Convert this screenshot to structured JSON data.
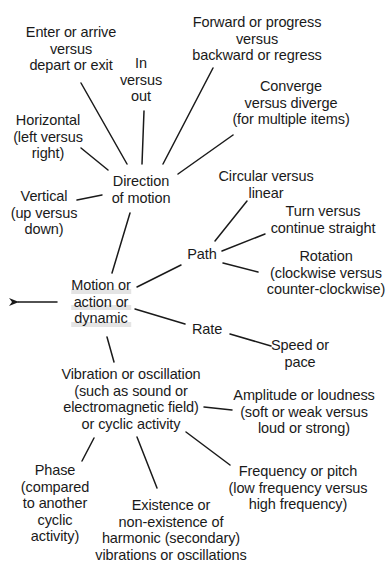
{
  "diagram": {
    "type": "concept-map",
    "colors": {
      "line": "#1a1a1a",
      "text": "#1a1a1a",
      "background": "#ffffff",
      "root_highlight": "#e4e4e4"
    },
    "root": {
      "id": "motion",
      "lines": [
        "Motion or",
        "action or",
        "dynamic"
      ],
      "arrow": "left-arrow"
    },
    "nodes": {
      "direction": {
        "lines": [
          "Direction",
          "of motion"
        ]
      },
      "enter": {
        "lines": [
          "Enter or arrive",
          "versus",
          "depart or exit"
        ]
      },
      "inout": {
        "lines": [
          "In",
          "versus",
          "out"
        ]
      },
      "forward": {
        "lines": [
          "Forward or progress",
          "versus",
          "backward or regress"
        ]
      },
      "converge": {
        "lines": [
          "Converge",
          "versus diverge",
          "(for multiple items)"
        ]
      },
      "horizontal": {
        "lines": [
          "Horizontal",
          "(left versus",
          "right)"
        ]
      },
      "vertical": {
        "lines": [
          "Vertical",
          "(up versus",
          "down)"
        ]
      },
      "path": {
        "lines": [
          "Path"
        ]
      },
      "circular": {
        "lines": [
          "Circular versus",
          "linear"
        ]
      },
      "turn": {
        "lines": [
          "Turn versus",
          "continue straight"
        ]
      },
      "rotation": {
        "lines": [
          "Rotation",
          "(clockwise versus",
          "counter-clockwise)"
        ]
      },
      "rate": {
        "lines": [
          "Rate"
        ]
      },
      "speed": {
        "lines": [
          "Speed or",
          "pace"
        ]
      },
      "vibration": {
        "lines": [
          "Vibration or oscillation",
          "(such as sound or",
          "electromagnetic field)",
          "or cyclic activity"
        ]
      },
      "amplitude": {
        "lines": [
          "Amplitude or loudness",
          "(soft or weak versus",
          "loud or strong)"
        ]
      },
      "frequency": {
        "lines": [
          "Frequency or pitch",
          "(low frequency versus",
          "high frequency)"
        ]
      },
      "phase": {
        "lines": [
          "Phase",
          "(compared",
          "to another",
          "cyclic",
          "activity)"
        ]
      },
      "existence": {
        "lines": [
          "Existence or",
          "non-existence of",
          "harmonic (secondary)",
          "vibrations or oscillations"
        ]
      }
    },
    "edges": [
      [
        "motion",
        "direction"
      ],
      [
        "direction",
        "enter"
      ],
      [
        "direction",
        "inout"
      ],
      [
        "direction",
        "forward"
      ],
      [
        "direction",
        "converge"
      ],
      [
        "direction",
        "horizontal"
      ],
      [
        "direction",
        "vertical"
      ],
      [
        "motion",
        "path"
      ],
      [
        "path",
        "circular"
      ],
      [
        "path",
        "turn"
      ],
      [
        "path",
        "rotation"
      ],
      [
        "motion",
        "rate"
      ],
      [
        "rate",
        "speed"
      ],
      [
        "motion",
        "vibration"
      ],
      [
        "vibration",
        "amplitude"
      ],
      [
        "vibration",
        "frequency"
      ],
      [
        "vibration",
        "phase"
      ],
      [
        "vibration",
        "existence"
      ]
    ]
  }
}
